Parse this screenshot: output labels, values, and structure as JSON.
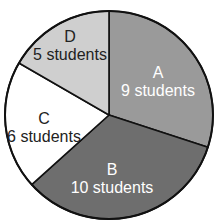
{
  "chart_data": {
    "type": "pie",
    "title": "",
    "categories": [
      "A",
      "B",
      "C",
      "D"
    ],
    "values": [
      9,
      10,
      6,
      5
    ],
    "unit": "students",
    "labels": [
      "A\n9 students",
      "B\n10 students",
      "C\n6 students",
      "D\n5 students"
    ],
    "slices": [
      {
        "name": "A",
        "value": 9,
        "label": "9 students",
        "color": "#9a9a9a",
        "text_color": "#ffffff"
      },
      {
        "name": "B",
        "value": 10,
        "label": "10 students",
        "color": "#6e6e6e",
        "text_color": "#ffffff"
      },
      {
        "name": "C",
        "value": 6,
        "label": "6 students",
        "color": "#ffffff",
        "text_color": "#222222"
      },
      {
        "name": "D",
        "value": 5,
        "label": "5 students",
        "color": "#cfcfcf",
        "text_color": "#222222"
      }
    ],
    "start_angle_deg": 0,
    "direction": "clockwise",
    "legend": "none"
  }
}
